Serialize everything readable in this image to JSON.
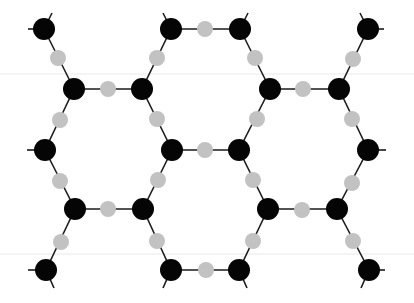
{
  "diagram": {
    "type": "hexagonal-lattice",
    "background": "#ffffff",
    "colors": {
      "atom_a": "#050505",
      "atom_b": "#c2c2c2",
      "bond": "#1a1a1a"
    },
    "radii": {
      "atom_a": 11,
      "atom_b": 8
    },
    "atoms_a": [
      [
        44,
        29
      ],
      [
        171,
        29
      ],
      [
        240,
        29
      ],
      [
        368,
        29
      ],
      [
        74,
        89
      ],
      [
        142,
        89
      ],
      [
        270,
        89
      ],
      [
        339,
        89
      ],
      [
        45,
        150
      ],
      [
        172,
        150
      ],
      [
        239,
        150
      ],
      [
        368,
        150
      ],
      [
        75,
        209
      ],
      [
        143,
        209
      ],
      [
        268,
        209
      ],
      [
        337,
        209
      ],
      [
        46,
        270
      ],
      [
        171,
        270
      ],
      [
        239,
        270
      ],
      [
        369,
        270
      ]
    ],
    "atoms_b": [
      [
        205,
        29
      ],
      [
        58,
        58
      ],
      [
        157,
        58
      ],
      [
        255,
        58
      ],
      [
        353,
        59
      ],
      [
        108,
        89
      ],
      [
        303,
        89
      ],
      [
        60,
        120
      ],
      [
        157,
        119
      ],
      [
        257,
        119
      ],
      [
        352,
        119
      ],
      [
        205,
        150
      ],
      [
        60,
        181
      ],
      [
        158,
        180
      ],
      [
        253,
        180
      ],
      [
        352,
        183
      ],
      [
        108,
        209
      ],
      [
        302,
        210
      ],
      [
        61,
        242
      ],
      [
        157,
        241
      ],
      [
        253,
        241
      ],
      [
        353,
        241
      ],
      [
        206,
        270
      ]
    ],
    "bonds": [
      [
        [
          44,
          29
        ],
        [
          74,
          89
        ]
      ],
      [
        [
          171,
          29
        ],
        [
          142,
          89
        ]
      ],
      [
        [
          171,
          29
        ],
        [
          240,
          29
        ]
      ],
      [
        [
          240,
          29
        ],
        [
          270,
          89
        ]
      ],
      [
        [
          368,
          29
        ],
        [
          339,
          89
        ]
      ],
      [
        [
          74,
          89
        ],
        [
          142,
          89
        ]
      ],
      [
        [
          270,
          89
        ],
        [
          339,
          89
        ]
      ],
      [
        [
          74,
          89
        ],
        [
          45,
          150
        ]
      ],
      [
        [
          142,
          89
        ],
        [
          172,
          150
        ]
      ],
      [
        [
          270,
          89
        ],
        [
          239,
          150
        ]
      ],
      [
        [
          339,
          89
        ],
        [
          368,
          150
        ]
      ],
      [
        [
          172,
          150
        ],
        [
          239,
          150
        ]
      ],
      [
        [
          45,
          150
        ],
        [
          75,
          209
        ]
      ],
      [
        [
          172,
          150
        ],
        [
          143,
          209
        ]
      ],
      [
        [
          239,
          150
        ],
        [
          268,
          209
        ]
      ],
      [
        [
          368,
          150
        ],
        [
          337,
          209
        ]
      ],
      [
        [
          75,
          209
        ],
        [
          143,
          209
        ]
      ],
      [
        [
          268,
          209
        ],
        [
          337,
          209
        ]
      ],
      [
        [
          75,
          209
        ],
        [
          46,
          270
        ]
      ],
      [
        [
          143,
          209
        ],
        [
          171,
          270
        ]
      ],
      [
        [
          268,
          209
        ],
        [
          239,
          270
        ]
      ],
      [
        [
          337,
          209
        ],
        [
          369,
          270
        ]
      ],
      [
        [
          171,
          270
        ],
        [
          239,
          270
        ]
      ]
    ],
    "stubs": [
      [
        [
          44,
          29
        ],
        [
          28,
          29
        ]
      ],
      [
        [
          44,
          29
        ],
        [
          52,
          13
        ]
      ],
      [
        [
          171,
          29
        ],
        [
          163,
          13
        ]
      ],
      [
        [
          240,
          29
        ],
        [
          248,
          13
        ]
      ],
      [
        [
          368,
          29
        ],
        [
          384,
          29
        ]
      ],
      [
        [
          368,
          29
        ],
        [
          360,
          13
        ]
      ],
      [
        [
          45,
          150
        ],
        [
          27,
          150
        ]
      ],
      [
        [
          368,
          150
        ],
        [
          386,
          150
        ]
      ],
      [
        [
          46,
          270
        ],
        [
          28,
          270
        ]
      ],
      [
        [
          46,
          270
        ],
        [
          54,
          288
        ]
      ],
      [
        [
          171,
          270
        ],
        [
          163,
          288
        ]
      ],
      [
        [
          239,
          270
        ],
        [
          247,
          288
        ]
      ],
      [
        [
          369,
          270
        ],
        [
          385,
          270
        ]
      ],
      [
        [
          369,
          270
        ],
        [
          361,
          288
        ]
      ]
    ],
    "artifacts": [
      [
        [
          0,
          74
        ],
        [
          414,
          74
        ]
      ],
      [
        [
          0,
          254
        ],
        [
          414,
          254
        ]
      ]
    ]
  }
}
